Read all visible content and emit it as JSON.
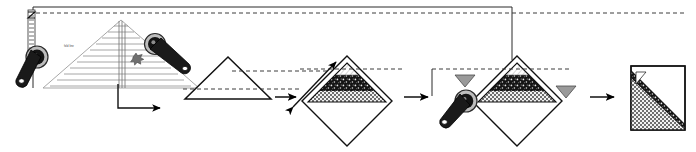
{
  "diagram": {
    "type": "process-sequence",
    "stage_count": 5,
    "colors": {
      "outline": "#1a1a1a",
      "ink": "#000000",
      "guide": "#555555",
      "marker_gray": "#9a9a9a",
      "stipple_dark": "#141414",
      "check_mid": "#7d7d7d",
      "paper": "#ffffff",
      "faint_rule": "#b8b8b8"
    },
    "guides": {
      "top_dashed_label": "top alignment guide",
      "frame_label": "work area frame",
      "dashed_pattern": "4 3"
    },
    "stages": [
      {
        "index": 1,
        "name": "pleated-triangle-layout",
        "caption": "",
        "ruled_lines": 11,
        "note_text": "fold line",
        "tools": [
          "roller-left",
          "roller-right"
        ],
        "markers": [
          "crosshair"
        ]
      },
      {
        "index": 2,
        "name": "plain-triangle",
        "caption": "",
        "tools": [],
        "markers": [
          "dashed-baseline"
        ]
      },
      {
        "index": 3,
        "name": "textured-diamond-first",
        "caption": "",
        "tools": [],
        "markers": [
          "double-headed-arrow",
          "dashed-baseline"
        ]
      },
      {
        "index": 4,
        "name": "textured-diamond-rolled",
        "caption": "",
        "tools": [
          "roller-overlay"
        ],
        "markers": [
          "gray-triangle-left",
          "gray-triangle-right",
          "dashed-baseline"
        ]
      },
      {
        "index": 5,
        "name": "finished-square",
        "caption": "",
        "tools": [],
        "markers": []
      }
    ],
    "arrows": [
      {
        "name": "elbow-arrow",
        "direction": "down-then-right"
      },
      {
        "name": "flow-arrow-1",
        "direction": "right"
      },
      {
        "name": "flow-arrow-2",
        "direction": "right"
      },
      {
        "name": "flow-arrow-3",
        "direction": "right"
      },
      {
        "name": "sizing-arrow",
        "direction": "diagonal-both"
      }
    ],
    "textures": [
      {
        "name": "stipple-dark",
        "description": "dark field with light speckles"
      },
      {
        "name": "checker-fine",
        "description": "fine gray checkerboard"
      },
      {
        "name": "hatch-light",
        "description": "light diagonal hatch at apex"
      }
    ]
  }
}
